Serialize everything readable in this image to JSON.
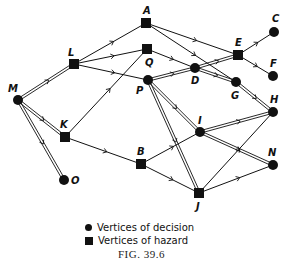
{
  "figure": {
    "caption": "FIG. 39.6",
    "legend": {
      "decision": "Vertices of decision",
      "hazard": "Vertices of hazard"
    }
  },
  "nodes": [
    {
      "id": "A",
      "type": "hazard",
      "x": 146,
      "y": 23,
      "lx": 143,
      "ly": 14
    },
    {
      "id": "C",
      "type": "decision",
      "x": 274,
      "y": 32,
      "lx": 272,
      "ly": 22
    },
    {
      "id": "E",
      "type": "hazard",
      "x": 238,
      "y": 55,
      "lx": 235,
      "ly": 46
    },
    {
      "id": "F",
      "type": "decision",
      "x": 273,
      "y": 76,
      "lx": 270,
      "ly": 67
    },
    {
      "id": "L",
      "type": "hazard",
      "x": 74,
      "y": 64,
      "lx": 68,
      "ly": 56
    },
    {
      "id": "Q",
      "type": "hazard",
      "x": 147,
      "y": 49,
      "lx": 145,
      "ly": 66
    },
    {
      "id": "D",
      "type": "decision",
      "x": 195,
      "y": 68,
      "lx": 191,
      "ly": 84
    },
    {
      "id": "G",
      "type": "decision",
      "x": 236,
      "y": 82,
      "lx": 231,
      "ly": 99
    },
    {
      "id": "P",
      "type": "decision",
      "x": 148,
      "y": 80,
      "lx": 136,
      "ly": 94
    },
    {
      "id": "M",
      "type": "decision",
      "x": 18,
      "y": 100,
      "lx": 8,
      "ly": 92
    },
    {
      "id": "H",
      "type": "decision",
      "x": 273,
      "y": 112,
      "lx": 270,
      "ly": 103
    },
    {
      "id": "I",
      "type": "decision",
      "x": 200,
      "y": 132,
      "lx": 198,
      "ly": 124
    },
    {
      "id": "K",
      "type": "hazard",
      "x": 65,
      "y": 137,
      "lx": 60,
      "ly": 128
    },
    {
      "id": "B",
      "type": "hazard",
      "x": 141,
      "y": 164,
      "lx": 137,
      "ly": 155
    },
    {
      "id": "N",
      "type": "decision",
      "x": 273,
      "y": 165,
      "lx": 268,
      "ly": 156
    },
    {
      "id": "O",
      "type": "decision",
      "x": 64,
      "y": 180,
      "lx": 71,
      "ly": 184
    },
    {
      "id": "J",
      "type": "hazard",
      "x": 199,
      "y": 193,
      "lx": 196,
      "ly": 210
    }
  ],
  "edges": [
    {
      "from": "M",
      "to": "L",
      "style": "double"
    },
    {
      "from": "M",
      "to": "K",
      "style": "double"
    },
    {
      "from": "M",
      "to": "O",
      "style": "double"
    },
    {
      "from": "L",
      "to": "A",
      "style": "single"
    },
    {
      "from": "L",
      "to": "Q",
      "style": "single"
    },
    {
      "from": "L",
      "to": "P",
      "style": "single"
    },
    {
      "from": "K",
      "to": "Q",
      "style": "single"
    },
    {
      "from": "K",
      "to": "B",
      "style": "single"
    },
    {
      "from": "A",
      "to": "E",
      "style": "single"
    },
    {
      "from": "A",
      "to": "G",
      "style": "single"
    },
    {
      "from": "Q",
      "to": "D",
      "style": "single"
    },
    {
      "from": "P",
      "to": "D",
      "style": "double"
    },
    {
      "from": "D",
      "to": "E",
      "style": "double"
    },
    {
      "from": "D",
      "to": "G",
      "style": "double"
    },
    {
      "from": "P",
      "to": "I",
      "style": "double"
    },
    {
      "from": "P",
      "to": "J",
      "style": "double"
    },
    {
      "from": "E",
      "to": "C",
      "style": "single"
    },
    {
      "from": "E",
      "to": "F",
      "style": "single"
    },
    {
      "from": "G",
      "to": "H",
      "style": "double"
    },
    {
      "from": "I",
      "to": "H",
      "style": "double"
    },
    {
      "from": "I",
      "to": "N",
      "style": "double"
    },
    {
      "from": "B",
      "to": "I",
      "style": "single"
    },
    {
      "from": "B",
      "to": "J",
      "style": "single"
    },
    {
      "from": "J",
      "to": "H",
      "style": "single"
    },
    {
      "from": "J",
      "to": "N",
      "style": "single"
    }
  ],
  "colors": {
    "ink": "#111111",
    "background": "#ffffff"
  }
}
